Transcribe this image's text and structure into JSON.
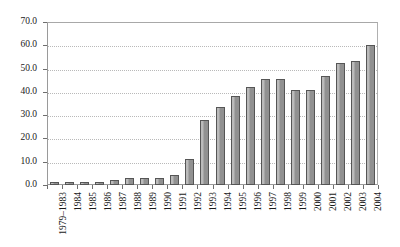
{
  "chart_data": {
    "type": "bar",
    "title": "",
    "subtitle": "",
    "xlabel": "",
    "ylabel": "",
    "ylim": [
      0,
      70
    ],
    "ytick_labels": [
      "0.0",
      "10.0",
      "20.0",
      "30.0",
      "40.0",
      "50.0",
      "60.0",
      "70.0"
    ],
    "ytick_values": [
      0,
      10,
      20,
      30,
      40,
      50,
      60,
      70
    ],
    "grid": true,
    "grid_axis": "y",
    "legend": false,
    "legend_position": "none",
    "bar_color": "#919191",
    "bar_edge_color": "#565656",
    "gridline_color": "#b9b9b9",
    "axis_color": "#9a9a9a",
    "xtick_rotation": 90,
    "categories": [
      "1979–1983",
      "1984",
      "1985",
      "1986",
      "1987",
      "1988",
      "1989",
      "1990",
      "1991",
      "1992",
      "1993",
      "1994",
      "1995",
      "1996",
      "1997",
      "1998",
      "1999",
      "2000",
      "2001",
      "2002",
      "2003",
      "2004"
    ],
    "values": [
      1.5,
      1.2,
      1.3,
      1.5,
      2.1,
      3.0,
      3.1,
      3.1,
      4.2,
      11.2,
      27.8,
      33.4,
      38.3,
      42.2,
      45.4,
      45.5,
      40.8,
      40.8,
      46.7,
      52.3,
      53.4,
      60.3
    ]
  }
}
